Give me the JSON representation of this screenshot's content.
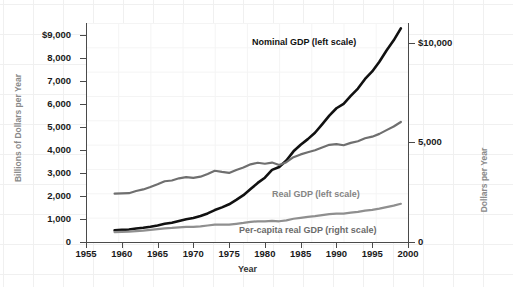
{
  "chart_data": {
    "type": "line",
    "title": "",
    "xlabel": "Year",
    "ylabel": "Billions of Dollars per Year",
    "ylabel_right": "Dollars per Year",
    "xlim": [
      1955,
      2000
    ],
    "ylim": [
      0,
      9500
    ],
    "ylim_right": [
      0,
      11000
    ],
    "grid": true,
    "legend_position": "inline-annotations",
    "x_ticks": [
      "1955",
      "1960",
      "1965",
      "1970",
      "1975",
      "1980",
      "1985",
      "1990",
      "1995",
      "2000"
    ],
    "x_tick_values": [
      1955,
      1960,
      1965,
      1970,
      1975,
      1980,
      1985,
      1990,
      1995,
      2000
    ],
    "y_ticks_left": [
      "0",
      "1,000",
      "2,000",
      "3,000",
      "4,000",
      "5,000",
      "6,000",
      "7,000",
      "8,000",
      "$9,000"
    ],
    "y_tick_values_left": [
      0,
      1000,
      2000,
      3000,
      4000,
      5000,
      6000,
      7000,
      8000,
      9000
    ],
    "y_ticks_right": [
      "0",
      "5,000",
      "$10,000"
    ],
    "y_tick_values_right": [
      0,
      5000,
      10000
    ],
    "x": [
      1959,
      1960,
      1961,
      1962,
      1963,
      1964,
      1965,
      1966,
      1967,
      1968,
      1969,
      1970,
      1971,
      1972,
      1973,
      1974,
      1975,
      1976,
      1977,
      1978,
      1979,
      1980,
      1981,
      1982,
      1983,
      1984,
      1985,
      1986,
      1987,
      1988,
      1989,
      1990,
      1991,
      1992,
      1993,
      1994,
      1995,
      1996,
      1997,
      1998,
      1999
    ],
    "series": [
      {
        "name": "Nominal GDP (left scale)",
        "scale": "left",
        "color": "#111111",
        "units": "Billions of Dollars per Year",
        "values": [
          507,
          527,
          545,
          586,
          618,
          664,
          719,
          788,
          833,
          910,
          985,
          1039,
          1128,
          1240,
          1385,
          1501,
          1635,
          1824,
          2031,
          2295,
          2563,
          2790,
          3128,
          3255,
          3537,
          3933,
          4220,
          4463,
          4740,
          5104,
          5484,
          5803,
          5996,
          6338,
          6657,
          7072,
          7398,
          7817,
          8304,
          8747,
          9268
        ]
      },
      {
        "name": "Real GDP (left scale)",
        "scale": "left",
        "color": "#8f8f8f",
        "units": "Billions of Dollars per Year",
        "values": [
          430,
          440,
          450,
          476,
          496,
          524,
          558,
          594,
          609,
          637,
          657,
          658,
          679,
          715,
          756,
          752,
          750,
          790,
          826,
          872,
          899,
          896,
          919,
          899,
          940,
          1008,
          1050,
          1086,
          1122,
          1168,
          1210,
          1232,
          1229,
          1272,
          1307,
          1361,
          1394,
          1446,
          1511,
          1578,
          1658
        ]
      },
      {
        "name": "Per-capita real GDP (right scale)",
        "scale": "right",
        "color": "#6f6f6f",
        "units": "Dollars per Year",
        "values": [
          2430,
          2440,
          2450,
          2560,
          2640,
          2760,
          2900,
          3050,
          3090,
          3200,
          3260,
          3220,
          3280,
          3420,
          3580,
          3520,
          3470,
          3620,
          3740,
          3900,
          3980,
          3930,
          3990,
          3870,
          4010,
          4260,
          4400,
          4510,
          4610,
          4750,
          4880,
          4920,
          4860,
          4980,
          5060,
          5210,
          5290,
          5430,
          5620,
          5800,
          6030
        ]
      }
    ]
  },
  "axes": {
    "x_title": "Year",
    "y_title_left": "Billions of Dollars per Year",
    "y_title_right": "Dollars per Year"
  },
  "annotations": {
    "nominal": "Nominal GDP (left scale)",
    "real": "Real GDP (left scale)",
    "percapita": "Per-capita real GDP (right scale)"
  },
  "colors": {
    "nominal": "#111111",
    "real": "#8f8f8f",
    "percapita": "#6f6f6f",
    "axis": "#4a4a4a",
    "axis_title": "#8a8a8a",
    "tick_text": "#1a1a1a",
    "background": "#ffffff",
    "grid": "#f0f0f0"
  }
}
